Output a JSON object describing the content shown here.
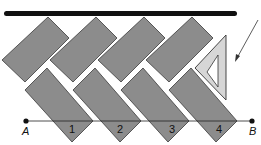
{
  "diagram": {
    "colors": {
      "tile": "#8c8c8c",
      "tile_edge": "#3a3a3a",
      "bar": "#111111",
      "triangle": "#d6d6d6"
    },
    "points": {
      "a_label": "A",
      "b_label": "B"
    },
    "tile_numbers": [
      "1",
      "2",
      "3",
      "4"
    ]
  }
}
